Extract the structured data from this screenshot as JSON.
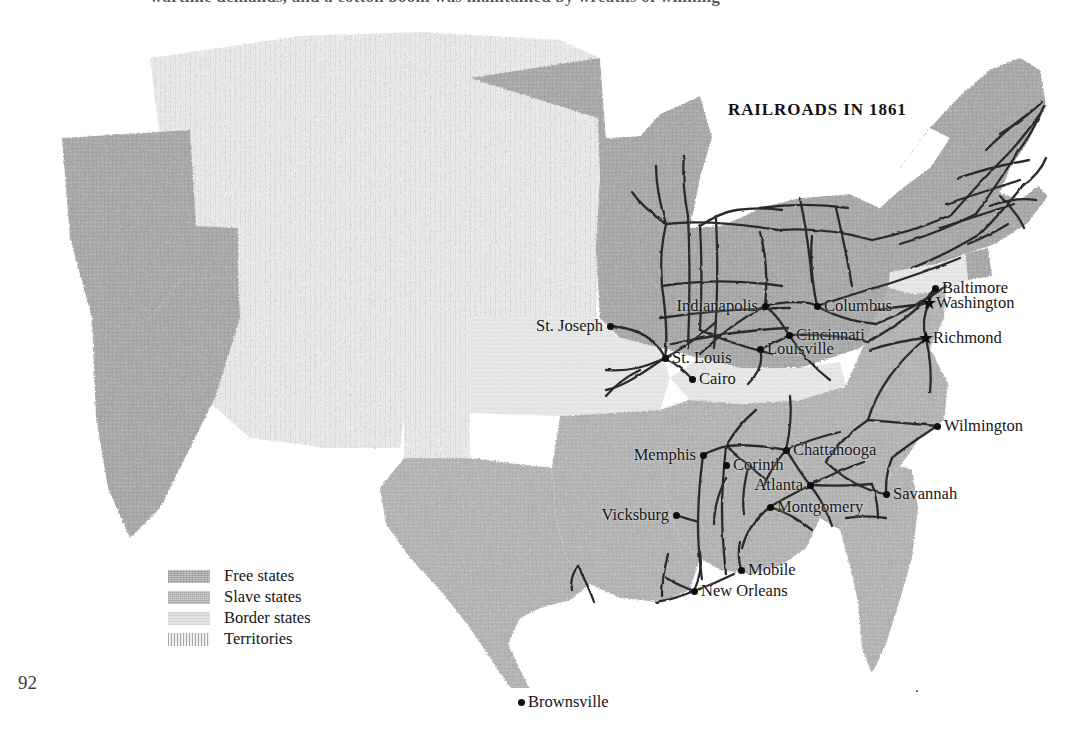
{
  "page": {
    "running_header": "wartime demands, and a cotton boom was maintained by wreaths of winning",
    "folio": "92"
  },
  "map": {
    "title": "RAILROADS IN 1861",
    "legend": [
      {
        "label": "Free states",
        "swatch": "free",
        "color": "#a9a9a9"
      },
      {
        "label": "Slave states",
        "swatch": "slave",
        "color": "#b4b4b4"
      },
      {
        "label": "Border states",
        "swatch": "border",
        "color": "#e2e2e2"
      },
      {
        "label": "Territories",
        "swatch": "terr",
        "color": "#f0f0f0"
      }
    ],
    "colors": {
      "free_states": "#a9a9a9",
      "slave_states": "#b4b4b4",
      "border_states": "#e2e2e2",
      "territories": "#e8e8e8",
      "railroad_line": "#2b2b2b",
      "marker": "#0d0d0d",
      "background": "#ffffff"
    },
    "cities": [
      {
        "name": "St. Joseph",
        "marker": "dot",
        "side": "left",
        "x": 610,
        "y": 308
      },
      {
        "name": "St. Louis",
        "marker": "dot",
        "side": "right",
        "x": 665,
        "y": 340
      },
      {
        "name": "Cairo",
        "marker": "dot",
        "side": "right",
        "x": 692,
        "y": 361
      },
      {
        "name": "Indianapolis",
        "marker": "dot",
        "side": "left",
        "x": 765,
        "y": 288
      },
      {
        "name": "Columbus",
        "marker": "dot",
        "side": "right",
        "x": 817,
        "y": 288
      },
      {
        "name": "Cincinnati",
        "marker": "dot",
        "side": "right",
        "x": 789,
        "y": 317
      },
      {
        "name": "Louisville",
        "marker": "dot",
        "side": "right",
        "x": 760,
        "y": 331
      },
      {
        "name": "Baltimore",
        "marker": "dot",
        "side": "right",
        "x": 935,
        "y": 270
      },
      {
        "name": "Washington",
        "marker": "star",
        "side": "right",
        "x": 929,
        "y": 285
      },
      {
        "name": "Richmond",
        "marker": "star",
        "side": "right",
        "x": 926,
        "y": 320
      },
      {
        "name": "Wilmington",
        "marker": "dot",
        "side": "right",
        "x": 937,
        "y": 408
      },
      {
        "name": "Savannah",
        "marker": "dot",
        "side": "right",
        "x": 886,
        "y": 476
      },
      {
        "name": "Memphis",
        "marker": "dot",
        "side": "left",
        "x": 703,
        "y": 437
      },
      {
        "name": "Chattanooga",
        "marker": "dot",
        "side": "right",
        "x": 786,
        "y": 432
      },
      {
        "name": "Corinth",
        "marker": "dot",
        "side": "right",
        "x": 726,
        "y": 447
      },
      {
        "name": "Atlanta",
        "marker": "dot",
        "side": "left",
        "x": 810,
        "y": 467
      },
      {
        "name": "Vicksburg",
        "marker": "dot",
        "side": "left",
        "x": 676,
        "y": 497
      },
      {
        "name": "Montgomery",
        "marker": "dot",
        "side": "right",
        "x": 770,
        "y": 489
      },
      {
        "name": "Mobile",
        "marker": "dot",
        "side": "right",
        "x": 741,
        "y": 552
      },
      {
        "name": "New Orleans",
        "marker": "dot",
        "side": "right",
        "x": 694,
        "y": 573
      },
      {
        "name": "Brownsville",
        "marker": "dot",
        "side": "right",
        "x": 521,
        "y": 684
      }
    ]
  }
}
